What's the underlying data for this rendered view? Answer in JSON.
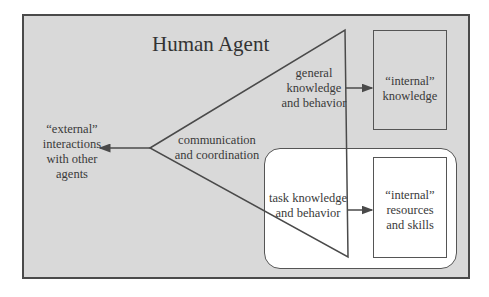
{
  "diagram": {
    "title": "Human Agent",
    "nodes": {
      "external": {
        "lines": [
          "“external”",
          "interactions",
          "with other",
          "agents"
        ]
      },
      "communication": {
        "lines": [
          "communication",
          "and coordination"
        ]
      },
      "general": {
        "lines": [
          "general",
          "knowledge",
          "and behavior"
        ]
      },
      "task": {
        "lines": [
          "task knowledge",
          "and behavior"
        ]
      },
      "internal_knowledge": {
        "lines": [
          "“internal”",
          "knowledge"
        ]
      },
      "internal_resources": {
        "lines": [
          "“internal”",
          "resources",
          "and skills"
        ]
      }
    },
    "edges": [
      {
        "from": "communication",
        "to": "external"
      },
      {
        "from": "general",
        "to": "internal_knowledge"
      },
      {
        "from": "task",
        "to": "internal_resources"
      }
    ],
    "colors": {
      "frame_fill": "#d9d9d9",
      "inner_fill": "#ffffff",
      "stroke": "#4a4a4a",
      "text": "#3a3a3a"
    }
  }
}
